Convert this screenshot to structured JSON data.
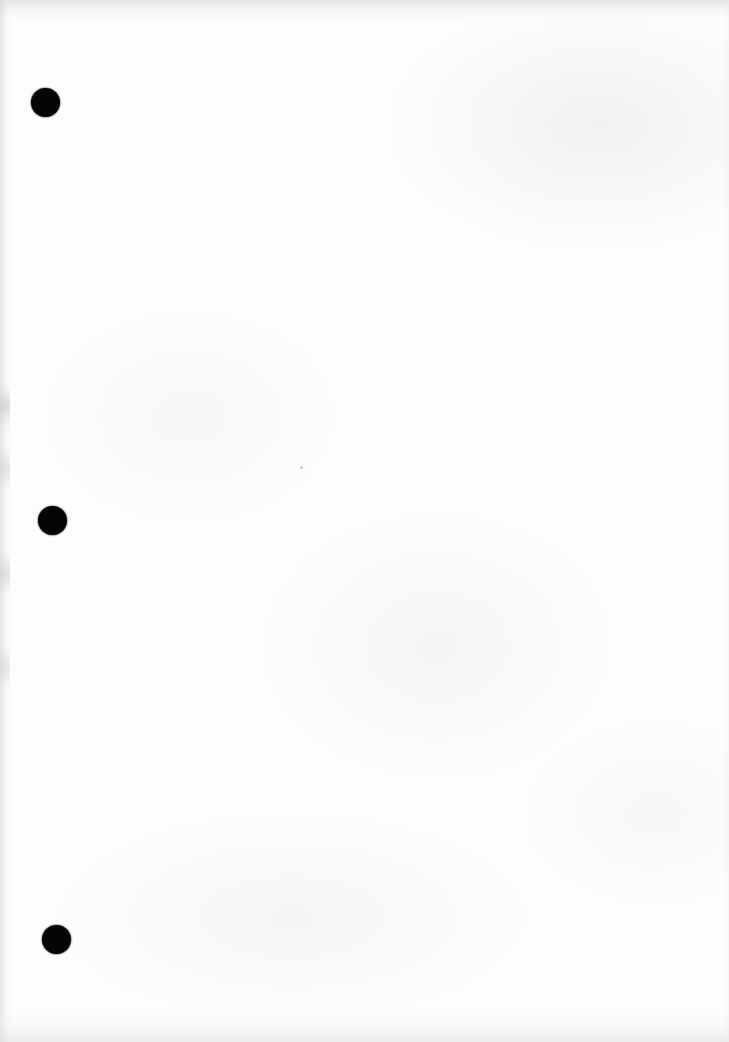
{
  "document": {
    "title": "Scanned Page",
    "page_width": 729,
    "page_height": 1042,
    "background_color": "#fdfdfd",
    "content_text": "",
    "description": "Blank scanned page with three solid black circular marks along the left margin"
  },
  "marks": {
    "color": "#050505",
    "items": [
      {
        "name": "punch-mark-top",
        "x": 31,
        "y": 88,
        "diameter": 29
      },
      {
        "name": "punch-mark-middle",
        "x": 38,
        "y": 506,
        "diameter": 29
      },
      {
        "name": "punch-mark-bottom",
        "x": 42,
        "y": 925,
        "diameter": 29
      }
    ]
  },
  "artifacts": {
    "speck": {
      "name": "stray-speck",
      "x": 300,
      "y": 466,
      "diameter": 3
    },
    "edge_tint": "#d6d6d8"
  }
}
